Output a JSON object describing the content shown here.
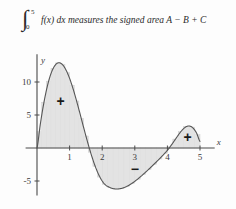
{
  "figure": {
    "name": "signed-area-integral-figure",
    "caption": {
      "integral_symbol": "∫",
      "upper_limit": "5",
      "lower_limit": "0",
      "body": "f(x) dx measures the signed area A − B + C",
      "integrand": "f(x) dx",
      "rest": "measures the signed area A − B + C"
    }
  },
  "chart_data": {
    "type": "area",
    "title": "",
    "xlabel": "x",
    "ylabel": "y",
    "xlim": [
      -0.35,
      5.45
    ],
    "ylim": [
      -7.2,
      14.2
    ],
    "xticks": [
      1,
      2,
      3,
      4,
      5
    ],
    "xtick_labels": [
      "1",
      "2",
      "3",
      "4",
      "5"
    ],
    "yticks": [
      5,
      10,
      -5
    ],
    "ytick_labels": [
      "5",
      "10",
      "-5"
    ],
    "grid": false,
    "legend": null,
    "curve_name": "f(x)",
    "curve_color": "#555555",
    "fill_color": "#e2e2e2",
    "riemann_strip_color": "#d9d9d9",
    "axis_color": "#4a4a4a",
    "roots": [
      0,
      2,
      4
    ],
    "regions": [
      {
        "label": "A",
        "sign": "+",
        "x_from": 0,
        "x_to": 2,
        "sign_x": 0.72,
        "sign_y": 7.1
      },
      {
        "label": "B",
        "sign": "−",
        "x_from": 2,
        "x_to": 4,
        "sign_x": 3.0,
        "sign_y": -3.2
      },
      {
        "label": "C",
        "sign": "+",
        "x_from": 4,
        "x_to": 5,
        "sign_x": 4.62,
        "sign_y": 1.7
      }
    ],
    "x": [
      0,
      0.1,
      0.2,
      0.3,
      0.4,
      0.5,
      0.6,
      0.7,
      0.8,
      0.9,
      1.0,
      1.1,
      1.2,
      1.3,
      1.4,
      1.5,
      1.6,
      1.7,
      1.8,
      1.9,
      2.0,
      2.1,
      2.2,
      2.3,
      2.4,
      2.5,
      2.6,
      2.7,
      2.8,
      2.9,
      3.0,
      3.1,
      3.2,
      3.3,
      3.4,
      3.5,
      3.6,
      3.7,
      3.8,
      3.9,
      4.0,
      4.1,
      4.2,
      4.3,
      4.4,
      4.5,
      4.6,
      4.7,
      4.8,
      4.9,
      5.0
    ],
    "y": [
      0,
      3.55,
      6.56,
      9.0,
      10.85,
      12.1,
      12.77,
      12.9,
      12.53,
      11.72,
      10.55,
      9.07,
      7.38,
      5.56,
      3.68,
      1.82,
      0.06,
      -1.55,
      -2.96,
      -4.12,
      -5.0,
      -5.59,
      -5.9,
      -6.11,
      -6.2,
      -6.2,
      -6.11,
      -5.94,
      -5.7,
      -5.4,
      -5.05,
      -4.66,
      -4.24,
      -3.8,
      -3.35,
      -2.88,
      -2.4,
      -1.92,
      -1.42,
      -0.9,
      -0.35,
      0.3,
      1.0,
      1.72,
      2.4,
      2.95,
      3.28,
      3.3,
      2.95,
      2.2,
      1.0
    ],
    "riemann": {
      "strip_count_positive": 14,
      "strip_count_negative": 12,
      "strip_count_third": 6,
      "note": "vertical Riemann strips shade each signed region"
    }
  }
}
